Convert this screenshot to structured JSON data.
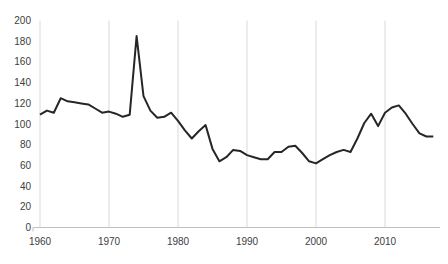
{
  "figure": {
    "title": "",
    "background_color": "#ffffff"
  },
  "chart_data": {
    "type": "line",
    "title": "",
    "xlabel": "",
    "ylabel": "",
    "x": [
      1960,
      1961,
      1962,
      1963,
      1964,
      1965,
      1966,
      1967,
      1968,
      1969,
      1970,
      1971,
      1972,
      1973,
      1974,
      1975,
      1976,
      1977,
      1978,
      1979,
      1980,
      1981,
      1982,
      1983,
      1984,
      1985,
      1986,
      1987,
      1988,
      1989,
      1990,
      1991,
      1992,
      1993,
      1994,
      1995,
      1996,
      1997,
      1998,
      1999,
      2000,
      2001,
      2002,
      2003,
      2004,
      2005,
      2006,
      2007,
      2008,
      2009,
      2010,
      2011,
      2012,
      2013,
      2014,
      2015,
      2016,
      2017
    ],
    "series": [
      {
        "name": "value",
        "values": [
          109,
          113,
          111,
          125,
          122,
          121,
          120,
          119,
          115,
          111,
          112,
          110,
          107,
          109,
          185,
          127,
          113,
          106,
          107,
          111,
          103,
          94,
          86,
          93,
          99,
          76,
          64,
          68,
          75,
          74,
          70,
          68,
          66,
          66,
          73,
          73,
          78,
          79,
          72,
          64,
          62,
          66,
          70,
          73,
          75,
          73,
          86,
          101,
          110,
          98,
          111,
          116,
          118,
          110,
          100,
          91,
          88,
          88
        ]
      }
    ],
    "x_ticks": [
      1960,
      1970,
      1980,
      1990,
      2000,
      2010
    ],
    "y_ticks": [
      0,
      20,
      40,
      60,
      80,
      100,
      120,
      140,
      160,
      180,
      200
    ],
    "xlim": [
      1960,
      2017
    ],
    "ylim": [
      0,
      200
    ],
    "grid": "vertical-decade-gridlines-only",
    "legend": false,
    "style": {
      "line_color": "#262626",
      "line_width": 2,
      "gridline_color": "#d9d9d9",
      "axis_line_color": "#bfbfbf",
      "tick_label_color": "#404040"
    }
  }
}
